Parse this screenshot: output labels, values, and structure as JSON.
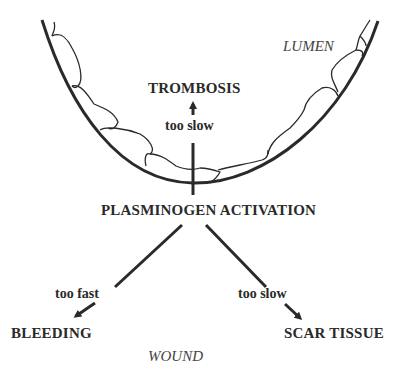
{
  "diagram": {
    "region_labels": {
      "lumen": "LUMEN",
      "wound": "WOUND"
    },
    "center_node": "PLASMINOGEN ACTIVATION",
    "outcomes": [
      {
        "id": "thrombosis",
        "label": "TROMBOSIS",
        "condition": "too slow",
        "direction": "up"
      },
      {
        "id": "bleeding",
        "label": "BLEEDING",
        "condition": "too fast",
        "direction": "down-left"
      },
      {
        "id": "scar",
        "label": "SCAR TISSUE",
        "condition": "too slow",
        "direction": "down-right"
      }
    ],
    "colors": {
      "ink": "#2a2a2a",
      "background": "#ffffff"
    }
  }
}
